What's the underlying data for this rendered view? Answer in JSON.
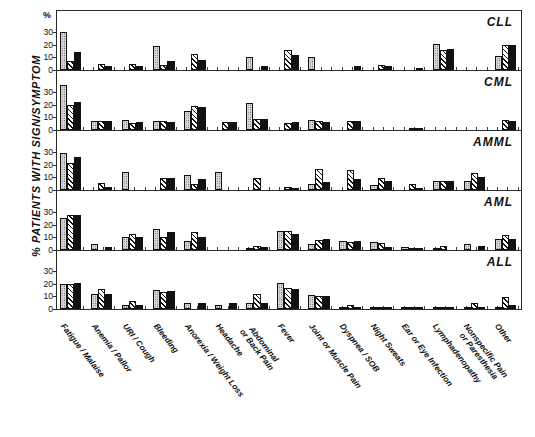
{
  "figure": {
    "ylabel": "% PATIENTS WITH SIGN/SYMPTOM",
    "percent_symbol": "%"
  },
  "chart_data": {
    "type": "bar",
    "title": "",
    "xlabel": "",
    "ylabel": "% PATIENTS WITH SIGN/SYMPTOM",
    "ylim": [
      0,
      38
    ],
    "yticks": [
      0,
      10,
      20,
      30
    ],
    "grid": false,
    "legend_position": "none",
    "panel_label_position": "top-right",
    "categories": [
      "Fatigue / Malaise",
      "Anemia / Pallor",
      "URI / Cough",
      "Bleeding",
      "Anorexia / Weight Loss",
      "Headache",
      "Abdominal\nor Back Pain",
      "Fever",
      "Joint or Muscle Pain",
      "Dyspnea / SOB",
      "Night Sweats",
      "Ear or Eye Infection",
      "Lymphadenopathy",
      "Nonspecific Pain\nor Paresthesia",
      "Other"
    ],
    "series_names": [
      "series-1-dotted",
      "series-2-hatched",
      "series-3-solid"
    ],
    "panels": [
      {
        "label": "CLL",
        "series": [
          {
            "name": "series-1-dotted",
            "values": [
              30,
              0,
              0,
              19,
              0,
              0,
              10.5,
              0,
              10.5,
              0,
              0,
              0,
              20.5,
              0,
              11
            ]
          },
          {
            "name": "series-2-hatched",
            "values": [
              7,
              4.5,
              4.5,
              4,
              12.5,
              0,
              0,
              15.5,
              0,
              0,
              4,
              0,
              15.5,
              0,
              19.5
            ]
          },
          {
            "name": "series-3-solid",
            "values": [
              14,
              3,
              3,
              7.5,
              8,
              0,
              3,
              11.5,
              0,
              3.5,
              3.5,
              1.5,
              17,
              0,
              20
            ]
          }
        ]
      },
      {
        "label": "CML",
        "series": [
          {
            "name": "series-1-dotted",
            "values": [
              36,
              7.5,
              8,
              7.5,
              15,
              0,
              21.5,
              0,
              8,
              0,
              0,
              0,
              0,
              0,
              0
            ]
          },
          {
            "name": "series-2-hatched",
            "values": [
              20,
              7,
              5.5,
              7,
              19,
              6,
              8.5,
              5.5,
              7,
              7.5,
              0,
              1.5,
              0,
              0,
              8
            ]
          },
          {
            "name": "series-3-solid",
            "values": [
              22,
              7,
              6,
              6.5,
              18.5,
              6.5,
              8.5,
              6,
              6.5,
              7,
              0,
              1.5,
              0,
              0,
              7.5
            ]
          }
        ]
      },
      {
        "label": "AMML",
        "series": [
          {
            "name": "series-1-dotted",
            "values": [
              29,
              0,
              14.5,
              0,
              11.5,
              14.5,
              0,
              0,
              4.5,
              0,
              4,
              0,
              7.5,
              7.5,
              0
            ]
          },
          {
            "name": "series-2-hatched",
            "values": [
              21.5,
              5.5,
              0,
              9.5,
              5,
              0,
              9.5,
              2.5,
              17,
              16,
              9.5,
              4.5,
              7.5,
              13.5,
              0
            ]
          },
          {
            "name": "series-3-solid",
            "values": [
              26,
              2.5,
              0,
              9.5,
              8.5,
              0,
              0,
              0.5,
              6.5,
              9,
              7.5,
              1.5,
              7.5,
              10.5,
              0
            ]
          }
        ]
      },
      {
        "label": "AML",
        "series": [
          {
            "name": "series-1-dotted",
            "values": [
              25.5,
              4.5,
              10.5,
              17,
              7.5,
              0,
              1.5,
              15,
              4.5,
              7,
              6.5,
              2.5,
              1.5,
              5,
              8.5
            ]
          },
          {
            "name": "series-2-hatched",
            "values": [
              27.5,
              0,
              12.5,
              10,
              14.5,
              0,
              3.5,
              15,
              8,
              6,
              5.5,
              1.5,
              3.5,
              0,
              12
            ]
          },
          {
            "name": "series-3-solid",
            "values": [
              27.5,
              2.5,
              10.5,
              14.5,
              10.5,
              0,
              2,
              13,
              8.5,
              7,
              2,
              1.5,
              0,
              3,
              8.5
            ]
          }
        ]
      },
      {
        "label": "ALL",
        "series": [
          {
            "name": "series-1-dotted",
            "values": [
              20,
              12,
              3,
              15,
              5,
              3.5,
              4.5,
              20.5,
              11,
              1,
              0.8,
              0.8,
              0.8,
              1.5,
              0.8
            ]
          },
          {
            "name": "series-2-hatched",
            "values": [
              20,
              15.5,
              6,
              13.5,
              0,
              0,
              11.5,
              16.5,
              10.5,
              3.5,
              1.2,
              1.2,
              1.2,
              5,
              9.5
            ]
          },
          {
            "name": "series-3-solid",
            "values": [
              20.5,
              12,
              3,
              14.5,
              4.5,
              4.5,
              4.5,
              16,
              10.5,
              1.5,
              1.5,
              1.5,
              1.5,
              1.5,
              3
            ]
          }
        ]
      }
    ]
  }
}
